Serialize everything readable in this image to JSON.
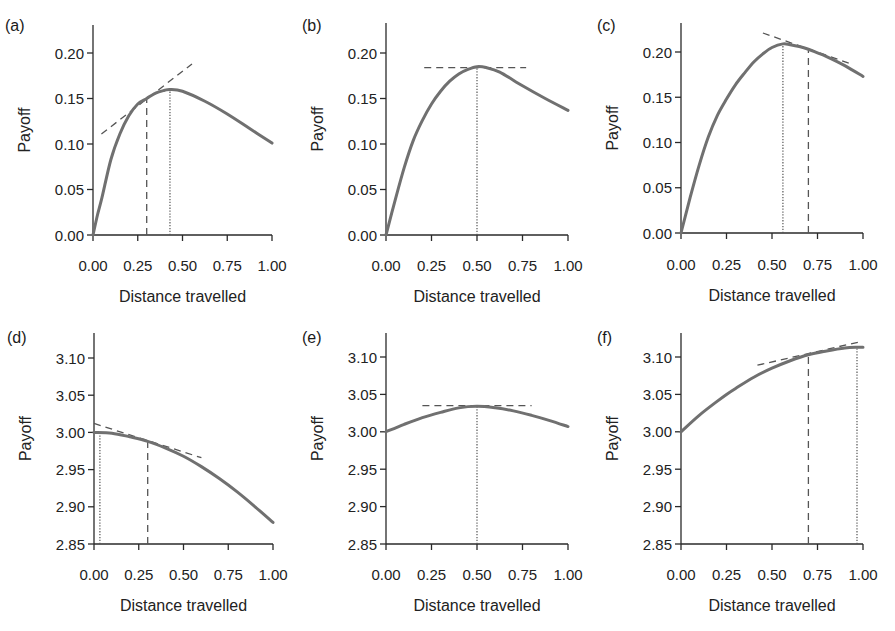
{
  "style": {
    "curve_color": "#707070",
    "annotation_color": "#555555",
    "axis_color": "#2a2a2a"
  },
  "chart_data": [
    {
      "panel": "(a)",
      "type": "line",
      "title": "(a)",
      "xlabel": "Distance travelled",
      "ylabel": "Payoff",
      "xlim": [
        0,
        1
      ],
      "ylim": [
        0,
        0.2
      ],
      "xticks": [
        0,
        0.25,
        0.5,
        0.75,
        1.0
      ],
      "xtick_labels": [
        "0.00",
        "0.25",
        "0.50",
        "0.75",
        "1.00"
      ],
      "yticks": [
        0,
        0.05,
        0.1,
        0.15,
        0.2
      ],
      "ytick_labels": [
        "0.00",
        "0.05",
        "0.10",
        "0.15",
        "0.20"
      ],
      "grid": false,
      "series": [
        {
          "name": "Payoff",
          "x": [
            0,
            0.025,
            0.05,
            0.1,
            0.15,
            0.2,
            0.25,
            0.3,
            0.35,
            0.4,
            0.43,
            0.5,
            0.625,
            0.75,
            0.875,
            1.0
          ],
          "y": [
            0,
            0.022,
            0.041,
            0.083,
            0.111,
            0.131,
            0.144,
            0.15,
            0.156,
            0.159,
            0.16,
            0.158,
            0.147,
            0.133,
            0.117,
            0.101
          ]
        }
      ],
      "annotations": [
        {
          "kind": "tangent",
          "style": "dashed",
          "x": [
            0.047,
            0.553
          ],
          "y": [
            0.111,
            0.188
          ]
        },
        {
          "kind": "vline",
          "style": "dashed",
          "x": 0.3,
          "y": [
            0,
            0.15
          ]
        },
        {
          "kind": "vline",
          "style": "dotted",
          "x": 0.43,
          "y": [
            0,
            0.16
          ]
        }
      ]
    },
    {
      "panel": "(b)",
      "type": "line",
      "title": "(b)",
      "xlabel": "Distance travelled",
      "ylabel": "Payoff",
      "xlim": [
        0,
        1
      ],
      "ylim": [
        0,
        0.2
      ],
      "xticks": [
        0,
        0.25,
        0.5,
        0.75,
        1.0
      ],
      "xtick_labels": [
        "0.00",
        "0.25",
        "0.50",
        "0.75",
        "1.00"
      ],
      "yticks": [
        0,
        0.05,
        0.1,
        0.15,
        0.2
      ],
      "ytick_labels": [
        "0.00",
        "0.05",
        "0.10",
        "0.15",
        "0.20"
      ],
      "grid": false,
      "series": [
        {
          "name": "Payoff",
          "x": [
            0,
            0.05,
            0.1,
            0.15,
            0.2,
            0.25,
            0.3,
            0.35,
            0.4,
            0.45,
            0.5,
            0.55,
            0.625,
            0.75,
            0.875,
            1.0
          ],
          "y": [
            0,
            0.038,
            0.074,
            0.104,
            0.126,
            0.144,
            0.158,
            0.169,
            0.177,
            0.182,
            0.185,
            0.184,
            0.179,
            0.164,
            0.15,
            0.137
          ]
        }
      ],
      "annotations": [
        {
          "kind": "tangent",
          "style": "dashed",
          "x": [
            0.21,
            0.77
          ],
          "y": [
            0.184,
            0.184
          ]
        },
        {
          "kind": "vline",
          "style": "dotted",
          "x": 0.5,
          "y": [
            0,
            0.185
          ]
        }
      ]
    },
    {
      "panel": "(c)",
      "type": "line",
      "title": "(c)",
      "xlabel": "Distance travelled",
      "ylabel": "Payoff",
      "xlim": [
        0,
        1
      ],
      "ylim": [
        0,
        0.2
      ],
      "xticks": [
        0,
        0.25,
        0.5,
        0.75,
        1.0
      ],
      "xtick_labels": [
        "0.00",
        "0.25",
        "0.50",
        "0.75",
        "1.00"
      ],
      "yticks": [
        0,
        0.05,
        0.1,
        0.15,
        0.2
      ],
      "ytick_labels": [
        "0.00",
        "0.05",
        "0.10",
        "0.15",
        "0.20"
      ],
      "grid": false,
      "series": [
        {
          "name": "Payoff",
          "x": [
            0,
            0.05,
            0.1,
            0.15,
            0.2,
            0.25,
            0.3,
            0.35,
            0.4,
            0.45,
            0.5,
            0.56,
            0.6,
            0.65,
            0.7,
            0.75,
            0.8,
            0.9,
            1.0
          ],
          "y": [
            0,
            0.039,
            0.075,
            0.106,
            0.13,
            0.148,
            0.164,
            0.177,
            0.189,
            0.198,
            0.205,
            0.209,
            0.208,
            0.206,
            0.203,
            0.199,
            0.195,
            0.185,
            0.173
          ]
        }
      ],
      "annotations": [
        {
          "kind": "tangent",
          "style": "dashed",
          "x": [
            0.45,
            0.945
          ],
          "y": [
            0.221,
            0.186
          ]
        },
        {
          "kind": "vline",
          "style": "dotted",
          "x": 0.56,
          "y": [
            0,
            0.209
          ]
        },
        {
          "kind": "vline",
          "style": "dashed",
          "x": 0.7,
          "y": [
            0,
            0.203
          ]
        }
      ]
    },
    {
      "panel": "(d)",
      "type": "line",
      "title": "(d)",
      "xlabel": "Distance travelled",
      "ylabel": "Payoff",
      "xlim": [
        0,
        1
      ],
      "ylim": [
        2.85,
        3.1
      ],
      "xticks": [
        0,
        0.25,
        0.5,
        0.75,
        1.0
      ],
      "xtick_labels": [
        "0.00",
        "0.25",
        "0.50",
        "0.75",
        "1.00"
      ],
      "yticks": [
        2.85,
        2.9,
        2.95,
        3.0,
        3.05,
        3.1
      ],
      "ytick_labels": [
        "2.85",
        "2.90",
        "2.95",
        "3.00",
        "3.05",
        "3.10"
      ],
      "grid": false,
      "series": [
        {
          "name": "Payoff",
          "x": [
            0,
            0.1,
            0.2,
            0.3,
            0.4,
            0.5,
            0.6,
            0.7,
            0.8,
            0.9,
            1.0
          ],
          "y": [
            3.0,
            2.999,
            2.994,
            2.988,
            2.979,
            2.968,
            2.954,
            2.938,
            2.92,
            2.9,
            2.879
          ]
        }
      ],
      "annotations": [
        {
          "kind": "tangent",
          "style": "dashed",
          "x": [
            0.0,
            0.6
          ],
          "y": [
            3.012,
            2.966
          ]
        },
        {
          "kind": "vline",
          "style": "dotted",
          "x": 0.033,
          "y": [
            2.85,
            3.0
          ]
        },
        {
          "kind": "vline",
          "style": "dashed",
          "x": 0.3,
          "y": [
            2.85,
            2.988
          ]
        }
      ]
    },
    {
      "panel": "(e)",
      "type": "line",
      "title": "(e)",
      "xlabel": "Distance travelled",
      "ylabel": "Payoff",
      "xlim": [
        0,
        1
      ],
      "ylim": [
        2.85,
        3.1
      ],
      "xticks": [
        0,
        0.25,
        0.5,
        0.75,
        1.0
      ],
      "xtick_labels": [
        "0.00",
        "0.25",
        "0.50",
        "0.75",
        "1.00"
      ],
      "yticks": [
        2.85,
        2.9,
        2.95,
        3.0,
        3.05,
        3.1
      ],
      "ytick_labels": [
        "2.85",
        "2.90",
        "2.95",
        "3.00",
        "3.05",
        "3.10"
      ],
      "grid": false,
      "series": [
        {
          "name": "Payoff",
          "x": [
            0,
            0.1,
            0.2,
            0.3,
            0.4,
            0.5,
            0.6,
            0.7,
            0.8,
            0.9,
            1.0
          ],
          "y": [
            3.0,
            3.01,
            3.019,
            3.026,
            3.032,
            3.034,
            3.032,
            3.028,
            3.022,
            3.015,
            3.007
          ]
        }
      ],
      "annotations": [
        {
          "kind": "tangent",
          "style": "dashed",
          "x": [
            0.2,
            0.8
          ],
          "y": [
            3.035,
            3.035
          ]
        },
        {
          "kind": "vline",
          "style": "dotted",
          "x": 0.5,
          "y": [
            2.85,
            3.034
          ]
        }
      ]
    },
    {
      "panel": "(f)",
      "type": "line",
      "title": "(f)",
      "xlabel": "Distance travelled",
      "ylabel": "Payoff",
      "xlim": [
        0,
        1
      ],
      "ylim": [
        2.85,
        3.1
      ],
      "xticks": [
        0,
        0.25,
        0.5,
        0.75,
        1.0
      ],
      "xtick_labels": [
        "0.00",
        "0.25",
        "0.50",
        "0.75",
        "1.00"
      ],
      "yticks": [
        2.85,
        2.9,
        2.95,
        3.0,
        3.05,
        3.1
      ],
      "ytick_labels": [
        "2.85",
        "2.90",
        "2.95",
        "3.00",
        "3.05",
        "3.10"
      ],
      "grid": false,
      "series": [
        {
          "name": "Payoff",
          "x": [
            0,
            0.1,
            0.2,
            0.25,
            0.3,
            0.4,
            0.5,
            0.6,
            0.7,
            0.8,
            0.9,
            0.97,
            1.0
          ],
          "y": [
            3.0,
            3.022,
            3.041,
            3.05,
            3.058,
            3.073,
            3.085,
            3.095,
            3.103,
            3.108,
            3.112,
            3.113,
            3.113
          ]
        }
      ],
      "annotations": [
        {
          "kind": "tangent",
          "style": "dashed",
          "x": [
            0.42,
            0.995
          ],
          "y": [
            3.089,
            3.121
          ]
        },
        {
          "kind": "vline",
          "style": "dashed",
          "x": 0.7,
          "y": [
            2.85,
            3.103
          ]
        },
        {
          "kind": "vline",
          "style": "dotted",
          "x": 0.967,
          "y": [
            2.85,
            3.113
          ]
        }
      ]
    }
  ]
}
